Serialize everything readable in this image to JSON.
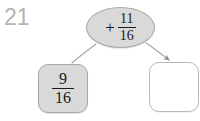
{
  "diagram": {
    "problem_number": "21",
    "type": "function-machine",
    "operator_node": {
      "operator": "+",
      "fraction": {
        "numerator": "11",
        "denominator": "16"
      }
    },
    "input_box": {
      "state": "filled",
      "fraction": {
        "numerator": "9",
        "denominator": "16"
      }
    },
    "output_box": {
      "state": "empty",
      "value": ""
    },
    "connectors": [
      {
        "name": "input-connector",
        "from": "operator-node",
        "to": "input-box",
        "arrowhead": false
      },
      {
        "name": "output-connector",
        "from": "operator-node",
        "to": "output-box",
        "arrowhead": true
      }
    ],
    "colors": {
      "background": "#ffffff",
      "node_fill": "#d9d9d9",
      "node_border": "#a8a8a8",
      "empty_fill": "#ffffff",
      "empty_border": "#b9b9b9",
      "text": "#1a1a1a",
      "number_label": "#b4b4b4",
      "connector": "#9a9a9a"
    }
  }
}
